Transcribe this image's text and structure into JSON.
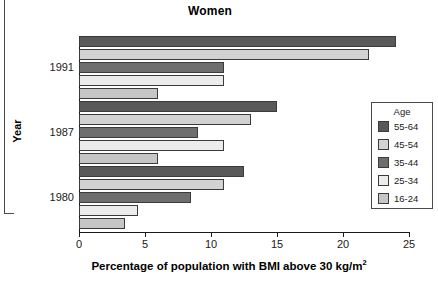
{
  "chart_data": {
    "type": "bar",
    "orientation": "horizontal",
    "title": "Women",
    "xlabel": "Percentage of population with BMI above 30 kg/m",
    "xlabel_sup": "2",
    "ylabel": "Year",
    "categories": [
      "1991",
      "1987",
      "1980"
    ],
    "xlim": [
      0,
      25
    ],
    "xticks": [
      0,
      5,
      10,
      15,
      20,
      25
    ],
    "xticklabels": [
      "0",
      "5",
      "10",
      "15",
      "20",
      "25"
    ],
    "grid": false,
    "legend": {
      "title": "Age",
      "position": "right-inside",
      "entries": [
        "55-64",
        "45-54",
        "35-44",
        "25-34",
        "16-24"
      ]
    },
    "series": [
      {
        "name": "55-64",
        "color": "#595959",
        "values": [
          24.0,
          15.0,
          12.5
        ]
      },
      {
        "name": "45-54",
        "color": "#d2d2d2",
        "values": [
          22.0,
          13.0,
          11.0
        ]
      },
      {
        "name": "35-44",
        "color": "#6e6e6e",
        "values": [
          11.0,
          9.0,
          8.5
        ]
      },
      {
        "name": "25-34",
        "color": "#ececec",
        "values": [
          11.0,
          11.0,
          4.5
        ]
      },
      {
        "name": "16-24",
        "color": "#c6c6c6",
        "values": [
          6.0,
          6.0,
          3.5
        ]
      }
    ]
  }
}
